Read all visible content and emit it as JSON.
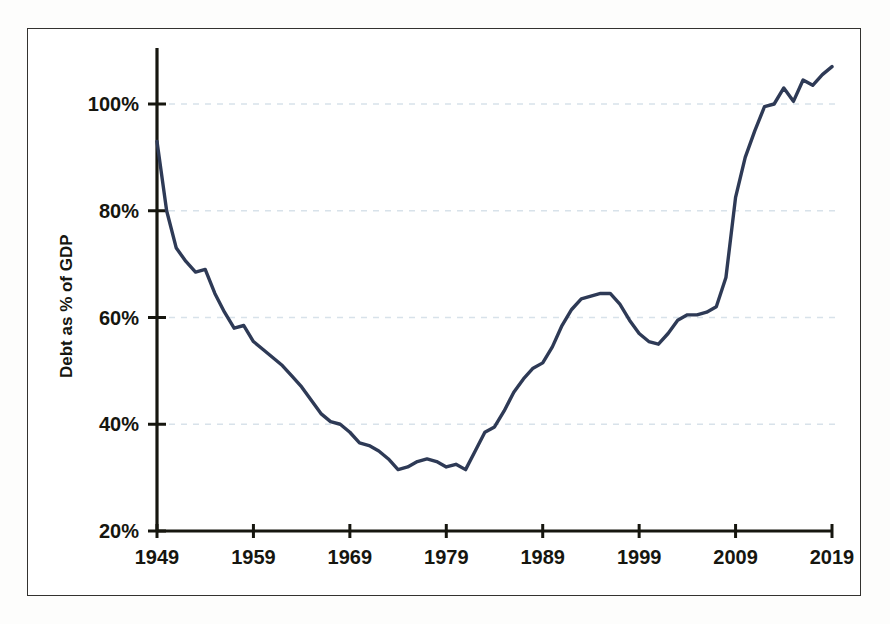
{
  "chart_data": {
    "type": "line",
    "title": "",
    "xlabel": "",
    "ylabel": "Debt as % of GDP",
    "xlim": [
      1949,
      2019
    ],
    "ylim": [
      20,
      108
    ],
    "grid": true,
    "legend": false,
    "line_color": "#2e3a56",
    "gridline_color": "#d8e2ea",
    "axis_color": "#16160f",
    "y_ticks": [
      "20%",
      "40%",
      "60%",
      "80%",
      "100%"
    ],
    "y_tick_values": [
      20,
      40,
      60,
      80,
      100
    ],
    "x_ticks": [
      "1949",
      "1959",
      "1969",
      "1979",
      "1989",
      "1999",
      "2009",
      "2019"
    ],
    "x_tick_values": [
      1949,
      1959,
      1969,
      1979,
      1989,
      1999,
      2009,
      2019
    ],
    "series": [
      {
        "name": "Debt as % of GDP",
        "x": [
          1949,
          1950,
          1951,
          1952,
          1953,
          1954,
          1955,
          1956,
          1957,
          1958,
          1959,
          1960,
          1961,
          1962,
          1963,
          1964,
          1965,
          1966,
          1967,
          1968,
          1969,
          1970,
          1971,
          1972,
          1973,
          1974,
          1975,
          1976,
          1977,
          1978,
          1979,
          1980,
          1981,
          1982,
          1983,
          1984,
          1985,
          1986,
          1987,
          1988,
          1989,
          1990,
          1991,
          1992,
          1993,
          1994,
          1995,
          1996,
          1997,
          1998,
          1999,
          2000,
          2001,
          2002,
          2003,
          2004,
          2005,
          2006,
          2007,
          2008,
          2009,
          2010,
          2011,
          2012,
          2013,
          2014,
          2015,
          2016,
          2017,
          2018,
          2019
        ],
        "values": [
          93.0,
          80.0,
          73.0,
          70.5,
          68.5,
          69.0,
          64.5,
          61.0,
          58.0,
          58.5,
          55.5,
          54.0,
          52.5,
          51.0,
          49.0,
          47.0,
          44.5,
          42.0,
          40.5,
          40.0,
          38.5,
          36.5,
          36.0,
          35.0,
          33.5,
          31.5,
          32.0,
          33.0,
          33.5,
          33.0,
          32.0,
          32.5,
          31.5,
          35.0,
          38.5,
          39.5,
          42.5,
          46.0,
          48.5,
          50.5,
          51.5,
          54.5,
          58.5,
          61.5,
          63.5,
          64.0,
          64.5,
          64.5,
          62.5,
          59.5,
          57.0,
          55.5,
          55.0,
          57.0,
          59.5,
          60.5,
          60.5,
          61.0,
          62.0,
          67.5,
          82.5,
          90.0,
          95.0,
          99.5,
          100.0,
          103.0,
          100.5,
          104.5,
          103.5,
          105.5,
          107.0
        ]
      }
    ]
  },
  "axis": {
    "y_label": "Debt as % of GDP"
  }
}
